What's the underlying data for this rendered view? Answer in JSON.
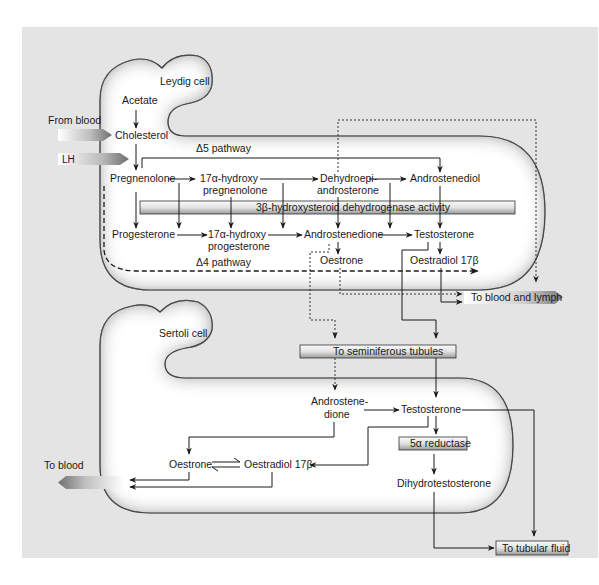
{
  "colors": {
    "background_panel": "#e4e4e4",
    "cell_fill": "#ffffff",
    "cell_outline": "#1a1a1a",
    "bar_fill_light": "#f2f2f2",
    "bar_fill_dark": "#8c8c8c",
    "text": "#1a1a1a"
  },
  "leydig": {
    "cell_label": "Leydig cell",
    "acetate": "Acetate",
    "cholesterol": "Cholesterol",
    "from_blood": "From blood",
    "lh": "LH",
    "delta5_pathway": "Δ5 pathway",
    "delta4_pathway": "Δ4 pathway",
    "pregnenolone": "Pregnenolone",
    "hydroxy_preg_1": "17α-hydroxy",
    "hydroxy_preg_2": "pregnenolone",
    "dhea_1": "Dehydroepi-",
    "dhea_2": "androsterone",
    "androstenediol": "Androstenediol",
    "enzyme_bar": "3β-hydroxysteroid dehydrogenase activity",
    "progesterone": "Progesterone",
    "hydroxy_prog_1": "17α-hydroxy",
    "hydroxy_prog_2": "progesterone",
    "androstenedione": "Androstenedione",
    "testosterone": "Testosterone",
    "oestrone": "Oestrone",
    "oestradiol": "Oestradiol 17β",
    "to_blood_lymph": "To blood and lymph"
  },
  "transfer": {
    "to_seminiferous": "To seminiferous tubules"
  },
  "sertoli": {
    "cell_label": "Sertoli cell",
    "androstenedione_1": "Androstene-",
    "androstenedione_2": "dione",
    "testosterone": "Testosterone",
    "reductase": "5α reductase",
    "dht": "Dihydrotestosterone",
    "oestrone": "Oestrone",
    "oestradiol": "Oestradiol 17β",
    "to_blood": "To blood",
    "to_tubular_fluid": "To tubular fluid"
  }
}
